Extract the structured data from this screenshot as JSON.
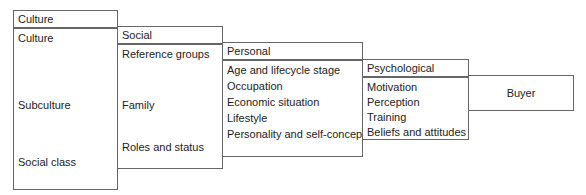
{
  "diagram": {
    "boxes": [
      {
        "id": "culture",
        "header": "Culture",
        "items": [
          "Culture",
          "Subculture",
          "Social class"
        ]
      },
      {
        "id": "social",
        "header": "Social",
        "items": [
          "Reference groups",
          "Family",
          "Roles and status"
        ]
      },
      {
        "id": "personal",
        "header": "Personal",
        "items": [
          "Age and lifecycle stage",
          "Occupation",
          "Economic situation",
          "Lifestyle",
          "Personality and self-concept"
        ]
      },
      {
        "id": "psychological",
        "header": "Psychological",
        "items": [
          "Motivation",
          "Perception",
          "Training",
          "Beliefs and attitudes"
        ]
      },
      {
        "id": "buyer",
        "label": "Buyer"
      }
    ]
  }
}
